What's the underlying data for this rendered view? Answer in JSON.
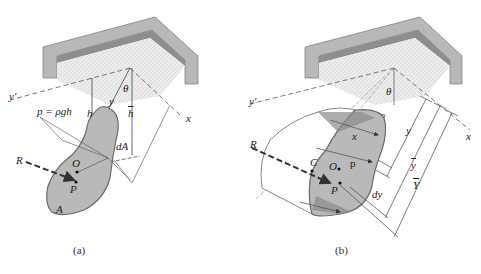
{
  "figure": {
    "panel_a": {
      "caption": "(a)",
      "labels": {
        "y_prime": "y′",
        "theta": "θ",
        "y": "y",
        "h": "h",
        "h_bar": "h",
        "x": "x",
        "pressure": "p = ρgh",
        "dA": "dA",
        "R": "R",
        "O": "O",
        "P": "P",
        "A": "A"
      }
    },
    "panel_b": {
      "caption": "(b)",
      "labels": {
        "y_prime": "y′",
        "theta": "θ",
        "x_axis": "x",
        "x": "x",
        "p": "p",
        "R": "R",
        "C": "C",
        "O": "O",
        "P": "P",
        "y": "y",
        "dy": "dy",
        "y_bar": "y",
        "Y_bar": "Y"
      }
    },
    "colors": {
      "plate_fill": "#b9b9b9",
      "plate_edge": "#6b6b6b",
      "tank_wall": "#9a9a9a",
      "water_surface": "#e6e6e6",
      "line": "#444444"
    }
  }
}
